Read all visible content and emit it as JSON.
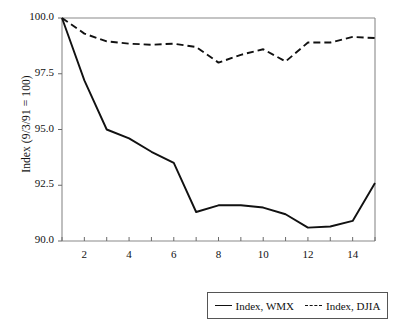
{
  "chart_data": {
    "type": "line",
    "title": "",
    "xlabel": "",
    "ylabel": "Index (9/3/91 = 100)",
    "x": [
      1,
      2,
      3,
      4,
      5,
      6,
      7,
      8,
      9,
      10,
      11,
      12,
      13,
      14,
      15
    ],
    "xlim": [
      1,
      15
    ],
    "ylim": [
      90.0,
      100.0
    ],
    "grid": false,
    "legend_position": "bottom-right",
    "yticks": [
      90.0,
      92.5,
      95.0,
      97.5,
      100.0
    ],
    "ytick_labels": [
      "90.0",
      "92.5",
      "95.0",
      "97.5",
      "100.0"
    ],
    "xticks": [
      2,
      4,
      6,
      8,
      10,
      12,
      14
    ],
    "xtick_labels": [
      "2",
      "4",
      "6",
      "8",
      "10",
      "12",
      "14"
    ],
    "xtick_minor": [
      1,
      3,
      5,
      7,
      9,
      11,
      13,
      15
    ],
    "series": [
      {
        "name": "Index, WMX",
        "style": "solid",
        "color": "#111111",
        "values": [
          100.0,
          97.2,
          95.0,
          94.6,
          94.0,
          93.5,
          91.3,
          91.6,
          91.6,
          91.5,
          91.2,
          90.6,
          90.65,
          90.9,
          92.6
        ]
      },
      {
        "name": "Index, DJIA",
        "style": "dashed",
        "color": "#111111",
        "values": [
          100.0,
          99.3,
          98.95,
          98.85,
          98.8,
          98.85,
          98.7,
          98.0,
          98.35,
          98.6,
          98.05,
          98.9,
          98.9,
          99.15,
          99.1
        ]
      }
    ]
  },
  "legend": {
    "entries": [
      {
        "label": "Index, WMX"
      },
      {
        "label": "Index, DJIA"
      }
    ]
  },
  "axes": {
    "y_axis_title": "Index (9/3/91 = 100)"
  }
}
